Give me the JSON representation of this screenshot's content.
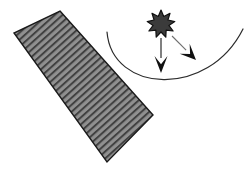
{
  "canvas": {
    "width": 252,
    "height": 169,
    "background": "#ffffff"
  },
  "palette": {
    "hatch_fill": "#909090",
    "hatch_stripe": "#414141",
    "hatch_outline": "#1a1a1a",
    "star_fill": "#3b3b3b",
    "star_outline": "#111111",
    "arrow_solid": "#111111",
    "arrow_thin_line": "#6f6f6f",
    "curve_stroke": "#2b2b2b",
    "background": "#ffffff"
  },
  "shapes": {
    "hatched_slab": {
      "name": "hatched-slab",
      "role": "tilted hatched rectangular surface",
      "corners": [
        [
          60,
          11
        ],
        [
          153,
          115
        ],
        [
          107,
          162
        ],
        [
          14,
          33
        ]
      ],
      "fill": "#909090",
      "outline": "#1a1a1a",
      "outline_width": 1.4,
      "hatch_angle_deg": 48,
      "hatch_spacing": 5.2,
      "hatch_width": 2.0,
      "stripe_count": 33
    },
    "burst_star": {
      "name": "burst-star",
      "role": "spiked star / burst source marker",
      "center": [
        161,
        24
      ],
      "outer_radius": 14,
      "inner_radius": 8,
      "points": 9,
      "fill": "#3b3b3b",
      "outline": "#111111",
      "outline_width": 1.2
    },
    "curve": {
      "name": "u-curve",
      "role": "thin open U shaped arc",
      "start": [
        107,
        32
      ],
      "control_1": [
        112,
        93
      ],
      "control_2": [
        208,
        99
      ],
      "end": [
        243,
        29
      ],
      "stroke": "#2b2b2b",
      "stroke_width": 1.2,
      "fill": "none"
    },
    "arrow_vertical": {
      "name": "arrow-down",
      "role": "vertical downward arrow from star",
      "start": [
        161,
        38
      ],
      "end": [
        161,
        73
      ],
      "shaft_width": 1.4,
      "head_length": 17,
      "head_half_width": 6.5,
      "color": "#111111"
    },
    "arrow_diagonal": {
      "name": "arrow-down-right",
      "role": "diagonal downward-right arrow from star",
      "start": [
        172,
        36
      ],
      "end": [
        196,
        60
      ],
      "shaft_width": 1.1,
      "head_length": 16,
      "head_half_width": 7,
      "shaft_color": "#6f6f6f",
      "head_color": "#111111"
    }
  }
}
